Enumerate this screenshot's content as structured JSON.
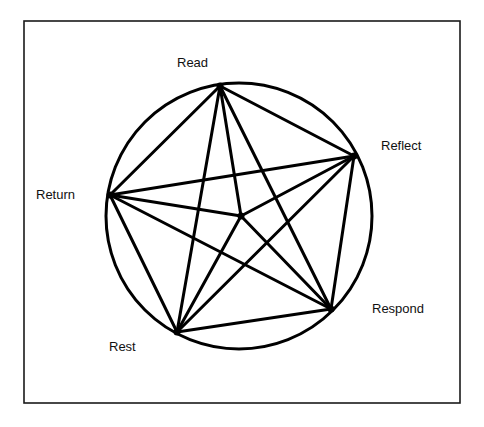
{
  "diagram": {
    "type": "complete-graph-in-circle",
    "frame": {
      "x1": 24,
      "y1": 21,
      "x2": 460,
      "y2": 403
    },
    "circle": {
      "cx": 239,
      "cy": 216,
      "r": 133
    },
    "nodes": [
      {
        "id": "read",
        "label": "Read",
        "x": 220,
        "y": 86,
        "label_x": 177,
        "label_y": 67
      },
      {
        "id": "reflect",
        "label": "Reflect",
        "x": 354,
        "y": 156,
        "label_x": 381,
        "label_y": 150
      },
      {
        "id": "respond",
        "label": "Respond",
        "x": 331,
        "y": 309,
        "label_x": 372,
        "label_y": 313
      },
      {
        "id": "rest",
        "label": "Rest",
        "x": 177,
        "y": 332,
        "label_x": 109,
        "label_y": 351
      },
      {
        "id": "return",
        "label": "Return",
        "x": 110,
        "y": 195,
        "label_x": 36,
        "label_y": 199
      },
      {
        "id": "center",
        "label": "",
        "x": 241,
        "y": 216
      }
    ],
    "edges": [
      [
        "read",
        "reflect"
      ],
      [
        "reflect",
        "respond"
      ],
      [
        "respond",
        "rest"
      ],
      [
        "rest",
        "return"
      ],
      [
        "return",
        "read"
      ],
      [
        "read",
        "respond"
      ],
      [
        "read",
        "rest"
      ],
      [
        "reflect",
        "return"
      ],
      [
        "reflect",
        "rest"
      ],
      [
        "return",
        "respond"
      ],
      [
        "read",
        "center"
      ],
      [
        "reflect",
        "center"
      ],
      [
        "respond",
        "center"
      ],
      [
        "rest",
        "center"
      ],
      [
        "return",
        "center"
      ]
    ],
    "colors": {
      "line": "#000000",
      "background": "#ffffff"
    }
  }
}
